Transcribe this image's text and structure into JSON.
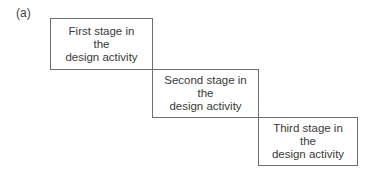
{
  "panel_label": "(a)",
  "stages": [
    {
      "line1": "First stage in",
      "line2": "the",
      "line3": "design activity"
    },
    {
      "line1": "Second stage in",
      "line2": "the",
      "line3": "design activity"
    },
    {
      "line1": "Third stage in",
      "line2": "the",
      "line3": "design activity"
    }
  ]
}
